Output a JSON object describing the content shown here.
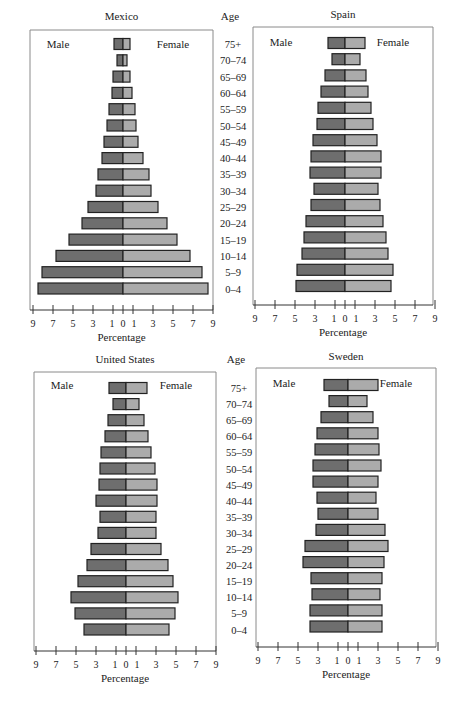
{
  "chart_data": [
    {
      "type": "bar",
      "subtype": "population-pyramid",
      "title": "Mexico",
      "xlabel": "Percentage",
      "ylabel": "Age",
      "legend": [
        "Male",
        "Female"
      ],
      "xlim": [
        -9,
        9
      ],
      "xticks": [
        9,
        7,
        5,
        3,
        1,
        0,
        1,
        3,
        5,
        7,
        9
      ],
      "categories": [
        "75+",
        "70–74",
        "65–69",
        "60–64",
        "55–59",
        "50–54",
        "45–49",
        "40–44",
        "35–39",
        "30–34",
        "25–29",
        "20–24",
        "15–19",
        "10–14",
        "5–9",
        "0–4"
      ],
      "series": [
        {
          "name": "Male",
          "values": [
            0.9,
            0.6,
            1.0,
            1.1,
            1.4,
            1.6,
            1.9,
            2.1,
            2.5,
            2.7,
            3.5,
            4.1,
            5.4,
            6.7,
            8.1,
            8.5
          ]
        },
        {
          "name": "Female",
          "values": [
            0.7,
            0.4,
            0.7,
            0.9,
            1.2,
            1.3,
            1.5,
            2.0,
            2.6,
            2.8,
            3.5,
            4.4,
            5.4,
            6.7,
            7.9,
            8.5
          ]
        }
      ]
    },
    {
      "type": "bar",
      "subtype": "population-pyramid",
      "title": "Spain",
      "xlabel": "Percentage",
      "ylabel": "Age",
      "legend": [
        "Male",
        "Female"
      ],
      "xlim": [
        -9,
        9
      ],
      "xticks": [
        9,
        7,
        5,
        3,
        1,
        0,
        1,
        3,
        5,
        7,
        9
      ],
      "categories": [
        "75+",
        "70–74",
        "65–69",
        "60–64",
        "55–59",
        "50–54",
        "45–49",
        "40–44",
        "35–39",
        "30–34",
        "25–29",
        "20–24",
        "15–19",
        "10–14",
        "5–9",
        "0–4"
      ],
      "series": [
        {
          "name": "Male",
          "values": [
            1.7,
            1.3,
            2.0,
            2.4,
            2.7,
            2.8,
            3.2,
            3.4,
            3.5,
            3.1,
            3.4,
            3.9,
            4.1,
            4.3,
            4.8,
            4.9
          ]
        },
        {
          "name": "Female",
          "values": [
            2.0,
            1.5,
            2.1,
            2.3,
            2.6,
            2.8,
            3.2,
            3.6,
            3.6,
            3.3,
            3.5,
            3.8,
            4.1,
            4.3,
            4.8,
            4.6
          ]
        }
      ]
    },
    {
      "type": "bar",
      "subtype": "population-pyramid",
      "title": "United States",
      "xlabel": "Percentage",
      "ylabel": "Age",
      "legend": [
        "Male",
        "Female"
      ],
      "xlim": [
        -9,
        9
      ],
      "xticks": [
        9,
        7,
        5,
        3,
        1,
        0,
        1,
        3,
        5,
        7,
        9
      ],
      "categories": [
        "75+",
        "70–74",
        "65–69",
        "60–64",
        "55–59",
        "50–54",
        "45–49",
        "40–44",
        "35–39",
        "30–34",
        "25–29",
        "20–24",
        "15–19",
        "10–14",
        "5–9",
        "0–4"
      ],
      "series": [
        {
          "name": "Male",
          "values": [
            1.7,
            1.3,
            1.8,
            2.1,
            2.5,
            2.6,
            2.7,
            3.0,
            2.6,
            2.8,
            3.5,
            3.9,
            4.8,
            5.5,
            5.1,
            4.2
          ]
        },
        {
          "name": "Female",
          "values": [
            2.1,
            1.3,
            1.8,
            2.2,
            2.5,
            2.9,
            3.1,
            3.1,
            3.0,
            3.0,
            3.5,
            4.2,
            4.7,
            5.2,
            4.9,
            4.3
          ]
        }
      ]
    },
    {
      "type": "bar",
      "subtype": "population-pyramid",
      "title": "Sweden",
      "xlabel": "Percentage",
      "ylabel": "Age",
      "legend": [
        "Male",
        "Female"
      ],
      "xlim": [
        -9,
        9
      ],
      "xticks": [
        9,
        7,
        5,
        3,
        1,
        0,
        1,
        3,
        5,
        7,
        9
      ],
      "categories": [
        "75+",
        "70–74",
        "65–69",
        "60–64",
        "55–59",
        "50–54",
        "45–49",
        "40–44",
        "35–39",
        "30–34",
        "25–29",
        "20–24",
        "15–19",
        "10–14",
        "5–9",
        "0–4"
      ],
      "series": [
        {
          "name": "Male",
          "values": [
            2.4,
            1.9,
            2.7,
            3.1,
            3.3,
            3.5,
            3.5,
            3.1,
            3.0,
            3.2,
            4.3,
            4.5,
            3.7,
            3.6,
            3.8,
            3.8
          ]
        },
        {
          "name": "Female",
          "values": [
            3.0,
            1.9,
            2.5,
            3.0,
            3.1,
            3.3,
            3.0,
            2.8,
            3.0,
            3.7,
            4.0,
            3.6,
            3.4,
            3.2,
            3.4,
            3.4
          ]
        }
      ]
    }
  ],
  "age_column_label": "Age",
  "colors": {
    "male": "#6e6e6e",
    "female": "#ababab",
    "border": "#222222",
    "frame": "#8a8a8a",
    "axis": "#333333"
  },
  "panels": [
    {
      "chart": 0,
      "frame": {
        "x": 30,
        "y": 30,
        "w": 183,
        "h": 280
      },
      "center": 123,
      "unit": 10.0,
      "axis_y": 310,
      "title_y": 20,
      "legend_y": 48,
      "row0_y": 44,
      "row_step": 16.3,
      "age_col_x": 240,
      "age_label_y": 20
    },
    {
      "chart": 1,
      "frame": {
        "x": 253,
        "y": 27,
        "w": 180,
        "h": 278
      },
      "center": 345,
      "unit": 10.0,
      "axis_y": 305,
      "title_y": 18,
      "legend_y": 46,
      "row0_y": 43,
      "row_step": 16.2,
      "age_col_x": null,
      "age_label_y": null
    },
    {
      "chart": 2,
      "frame": {
        "x": 34,
        "y": 372,
        "w": 182,
        "h": 279
      },
      "center": 126,
      "unit": 10.0,
      "axis_y": 651,
      "title_y": 363,
      "legend_y": 389,
      "row0_y": 388,
      "row_step": 16.1,
      "age_col_x": 246,
      "age_label_y": 363
    },
    {
      "chart": 3,
      "frame": {
        "x": 256,
        "y": 368,
        "w": 180,
        "h": 279
      },
      "center": 348,
      "unit": 10.0,
      "axis_y": 647,
      "title_y": 360,
      "legend_y": 387,
      "row0_y": 385,
      "row_step": 16.1,
      "age_col_x": null,
      "age_label_y": null
    }
  ]
}
